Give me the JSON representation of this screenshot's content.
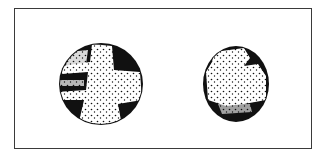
{
  "figure": {
    "frame": {
      "stroke": "#3a3a3a",
      "fill": "#ffffff"
    },
    "colonies": [
      {
        "id": "left",
        "cx": 101,
        "cy": 84,
        "rx": 42,
        "ry": 41,
        "pattern": "cross-shaped light stippled region on dark background",
        "ink": "#111111"
      },
      {
        "id": "right",
        "cx": 236,
        "cy": 84,
        "rx": 33,
        "ry": 38,
        "pattern": "mostly light stippled interior with dark rim and dark lower band",
        "ink": "#111111"
      }
    ]
  }
}
